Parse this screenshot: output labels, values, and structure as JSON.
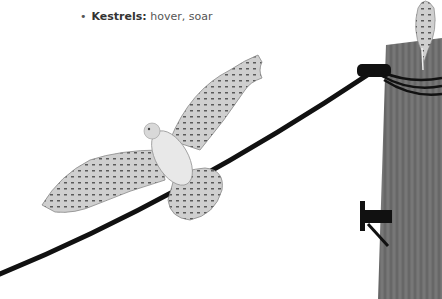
{
  "bullets": [
    {
      "term": "Harriers:",
      "desc": " harassment, swarm"
    },
    {
      "term": "Kestrels:",
      "desc": " hover, soar"
    }
  ],
  "illustration": {
    "subject": "kestrel-in-flight",
    "perched_bird": "kestrel-perched-on-pole",
    "elements": [
      "utility-pole",
      "power-line",
      "insulator",
      "pole-step"
    ],
    "colors": {
      "pole": "#6e6e6e",
      "wire": "#111111",
      "bird": "#c9c9c9",
      "bird_markings": "#555555"
    }
  }
}
